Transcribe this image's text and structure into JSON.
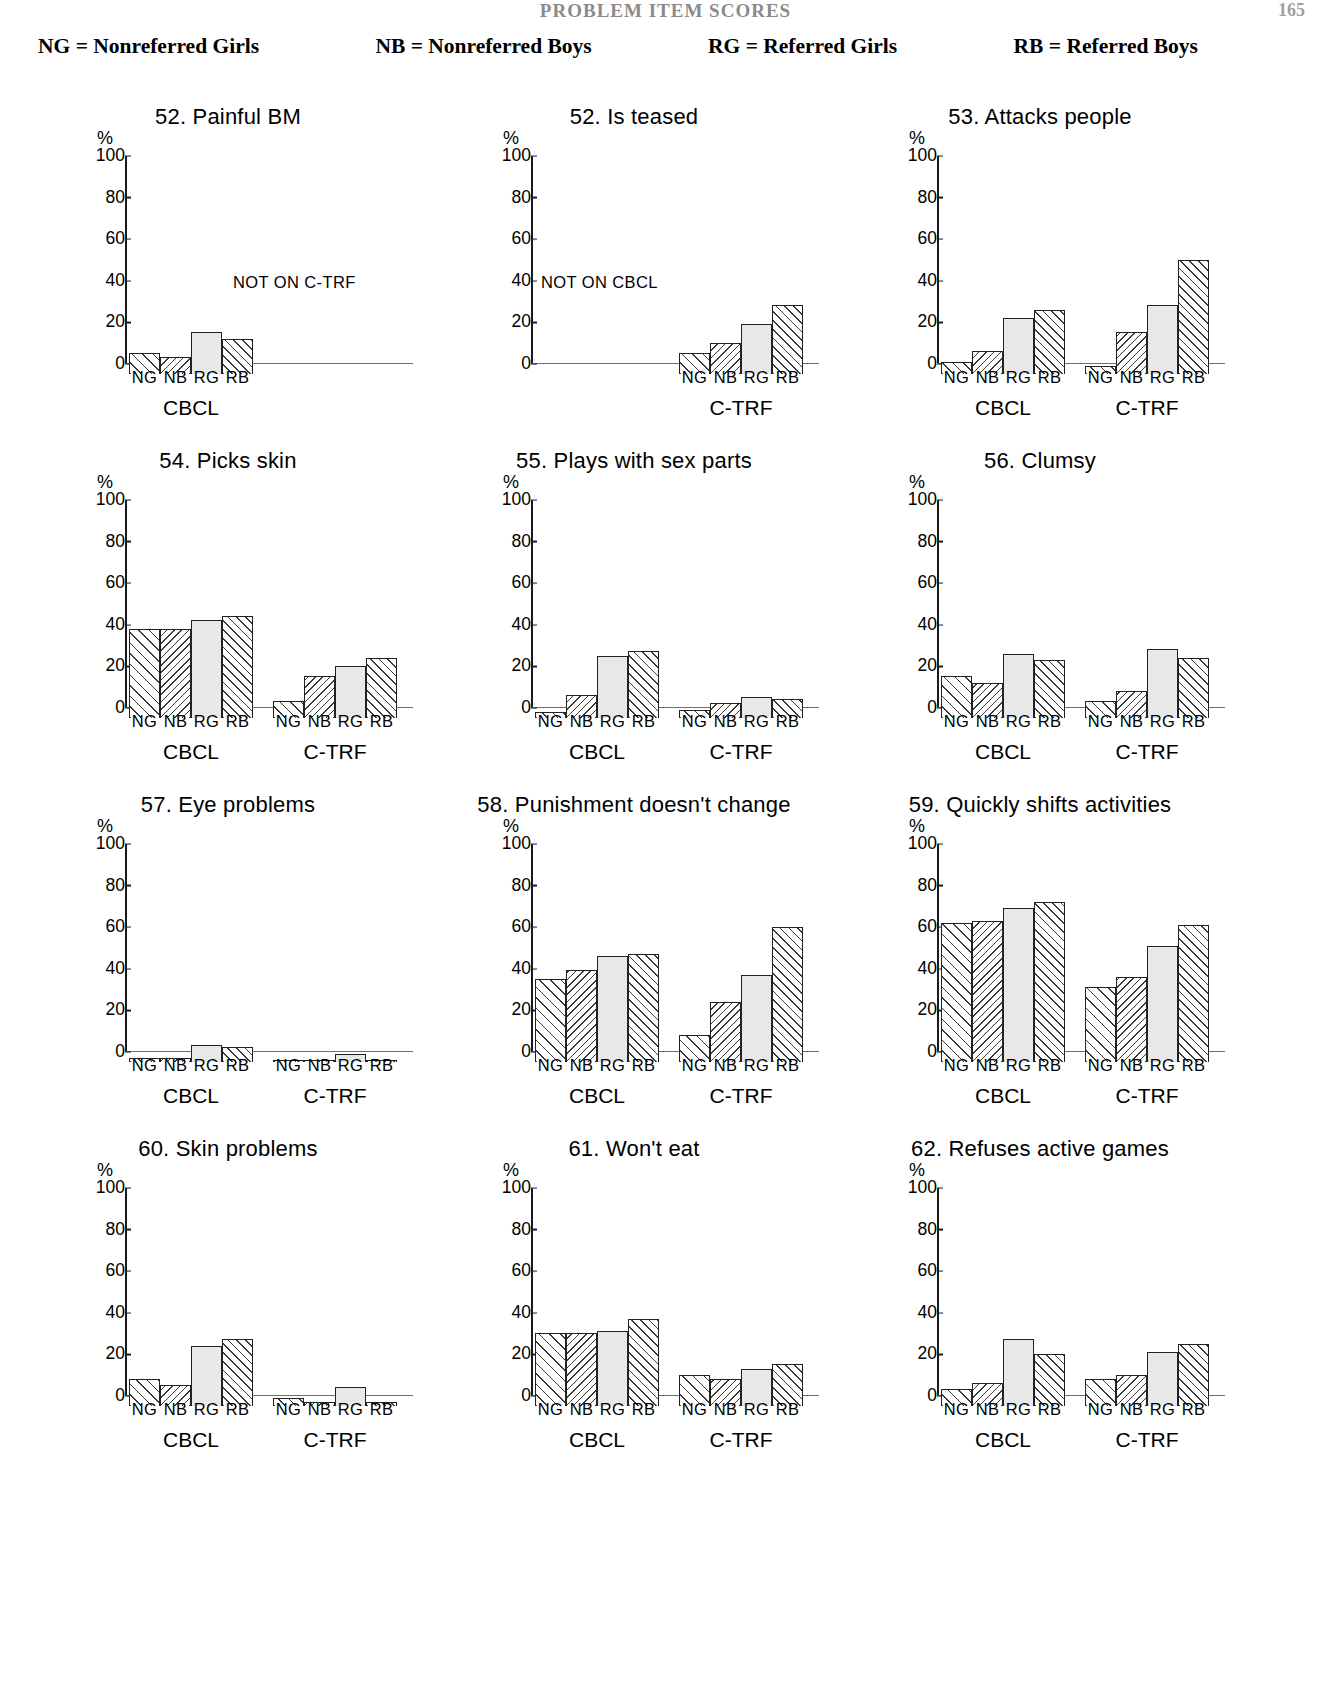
{
  "running_head": {
    "title": "PROBLEM ITEM SCORES",
    "page": "165"
  },
  "legend": [
    {
      "key": "NG",
      "eq": "=",
      "label": "Nonreferred Girls"
    },
    {
      "key": "NB",
      "eq": "=",
      "label": "Nonreferred Boys"
    },
    {
      "key": "RG",
      "eq": "=",
      "label": "Referred Girls"
    },
    {
      "key": "RB",
      "eq": "=",
      "label": "Referred Boys"
    }
  ],
  "axis": {
    "ylabel": "%",
    "yticks": [
      "100",
      "80",
      "60",
      "40",
      "20",
      "0"
    ],
    "xticklabels": [
      "NG",
      "NB",
      "RG",
      "RB"
    ],
    "group_labels": {
      "cbcl": "CBCL",
      "ctrf": "C-TRF"
    }
  },
  "notes": {
    "not_on_ctrf": "NOT ON C-TRF",
    "not_on_cbcl": "NOT ON CBCL"
  },
  "chart_data": [
    {
      "type": "bar",
      "title": "52. Painful BM",
      "ylabel": "%",
      "xlabel": "",
      "ylim": [
        0,
        100
      ],
      "categories": [
        "NG",
        "NB",
        "RG",
        "RB"
      ],
      "groups": [
        "CBCL",
        "C-TRF"
      ],
      "series": [
        {
          "name": "CBCL",
          "values": [
            10,
            8,
            20,
            17
          ]
        },
        {
          "name": "C-TRF",
          "values": null,
          "note": "NOT ON C-TRF"
        }
      ]
    },
    {
      "type": "bar",
      "title": "52. Is teased",
      "ylabel": "%",
      "xlabel": "",
      "ylim": [
        0,
        100
      ],
      "categories": [
        "NG",
        "NB",
        "RG",
        "RB"
      ],
      "groups": [
        "CBCL",
        "C-TRF"
      ],
      "series": [
        {
          "name": "CBCL",
          "values": null,
          "note": "NOT ON CBCL"
        },
        {
          "name": "C-TRF",
          "values": [
            10,
            15,
            24,
            33
          ]
        }
      ]
    },
    {
      "type": "bar",
      "title": "53. Attacks people",
      "ylabel": "%",
      "xlabel": "",
      "ylim": [
        0,
        100
      ],
      "categories": [
        "NG",
        "NB",
        "RG",
        "RB"
      ],
      "groups": [
        "CBCL",
        "C-TRF"
      ],
      "series": [
        {
          "name": "CBCL",
          "values": [
            6,
            11,
            27,
            31
          ]
        },
        {
          "name": "C-TRF",
          "values": [
            4,
            20,
            33,
            55
          ]
        }
      ]
    },
    {
      "type": "bar",
      "title": "54. Picks skin",
      "ylabel": "%",
      "xlabel": "",
      "ylim": [
        0,
        100
      ],
      "categories": [
        "NG",
        "NB",
        "RG",
        "RB"
      ],
      "groups": [
        "CBCL",
        "C-TRF"
      ],
      "series": [
        {
          "name": "CBCL",
          "values": [
            43,
            43,
            47,
            49
          ]
        },
        {
          "name": "C-TRF",
          "values": [
            8,
            20,
            25,
            29
          ]
        }
      ]
    },
    {
      "type": "bar",
      "title": "55. Plays with sex parts",
      "ylabel": "%",
      "xlabel": "",
      "ylim": [
        0,
        100
      ],
      "categories": [
        "NG",
        "NB",
        "RG",
        "RB"
      ],
      "groups": [
        "CBCL",
        "C-TRF"
      ],
      "series": [
        {
          "name": "CBCL",
          "values": [
            3,
            11,
            30,
            32
          ]
        },
        {
          "name": "C-TRF",
          "values": [
            4,
            7,
            10,
            9
          ]
        }
      ]
    },
    {
      "type": "bar",
      "title": "56. Clumsy",
      "ylabel": "%",
      "xlabel": "",
      "ylim": [
        0,
        100
      ],
      "categories": [
        "NG",
        "NB",
        "RG",
        "RB"
      ],
      "groups": [
        "CBCL",
        "C-TRF"
      ],
      "series": [
        {
          "name": "CBCL",
          "values": [
            20,
            17,
            31,
            28
          ]
        },
        {
          "name": "C-TRF",
          "values": [
            8,
            13,
            33,
            29
          ]
        }
      ]
    },
    {
      "type": "bar",
      "title": "57. Eye problems",
      "ylabel": "%",
      "xlabel": "",
      "ylim": [
        0,
        100
      ],
      "categories": [
        "NG",
        "NB",
        "RG",
        "RB"
      ],
      "groups": [
        "CBCL",
        "C-TRF"
      ],
      "series": [
        {
          "name": "CBCL",
          "values": [
            2,
            2,
            8,
            7
          ]
        },
        {
          "name": "C-TRF",
          "values": [
            1,
            1,
            4,
            1
          ]
        }
      ]
    },
    {
      "type": "bar",
      "title": "58. Punishment doesn't change",
      "ylabel": "%",
      "xlabel": "",
      "ylim": [
        0,
        100
      ],
      "categories": [
        "NG",
        "NB",
        "RG",
        "RB"
      ],
      "groups": [
        "CBCL",
        "C-TRF"
      ],
      "series": [
        {
          "name": "CBCL",
          "values": [
            40,
            44,
            51,
            52
          ]
        },
        {
          "name": "C-TRF",
          "values": [
            13,
            29,
            42,
            65
          ]
        }
      ]
    },
    {
      "type": "bar",
      "title": "59. Quickly shifts activities",
      "ylabel": "%",
      "xlabel": "",
      "ylim": [
        0,
        100
      ],
      "categories": [
        "NG",
        "NB",
        "RG",
        "RB"
      ],
      "groups": [
        "CBCL",
        "C-TRF"
      ],
      "series": [
        {
          "name": "CBCL",
          "values": [
            67,
            68,
            74,
            77
          ]
        },
        {
          "name": "C-TRF",
          "values": [
            36,
            41,
            56,
            66
          ]
        }
      ]
    },
    {
      "type": "bar",
      "title": "60. Skin problems",
      "ylabel": "%",
      "xlabel": "",
      "ylim": [
        0,
        100
      ],
      "categories": [
        "NG",
        "NB",
        "RG",
        "RB"
      ],
      "groups": [
        "CBCL",
        "C-TRF"
      ],
      "series": [
        {
          "name": "CBCL",
          "values": [
            13,
            10,
            29,
            32
          ]
        },
        {
          "name": "C-TRF",
          "values": [
            4,
            2,
            9,
            2
          ]
        }
      ]
    },
    {
      "type": "bar",
      "title": "61. Won't eat",
      "ylabel": "%",
      "xlabel": "",
      "ylim": [
        0,
        100
      ],
      "categories": [
        "NG",
        "NB",
        "RG",
        "RB"
      ],
      "groups": [
        "CBCL",
        "C-TRF"
      ],
      "series": [
        {
          "name": "CBCL",
          "values": [
            35,
            35,
            36,
            42
          ]
        },
        {
          "name": "C-TRF",
          "values": [
            15,
            13,
            18,
            20
          ]
        }
      ]
    },
    {
      "type": "bar",
      "title": "62. Refuses active games",
      "ylabel": "%",
      "xlabel": "",
      "ylim": [
        0,
        100
      ],
      "categories": [
        "NG",
        "NB",
        "RG",
        "RB"
      ],
      "groups": [
        "CBCL",
        "C-TRF"
      ],
      "series": [
        {
          "name": "CBCL",
          "values": [
            8,
            11,
            32,
            25
          ]
        },
        {
          "name": "C-TRF",
          "values": [
            13,
            15,
            26,
            30
          ]
        }
      ]
    }
  ]
}
